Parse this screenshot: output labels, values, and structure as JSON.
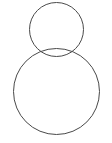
{
  "canvas": {
    "width": 112,
    "height": 143,
    "background_color": "#ffffff",
    "title": "Two overlapping circles"
  },
  "style": {
    "stroke_color": "#4a4a4a",
    "stroke_width": 1,
    "fill": "none"
  },
  "chart_data": {
    "type": "diagram",
    "shapes": [
      {
        "name": "small-circle",
        "kind": "circle",
        "center_x": 56.5,
        "center_y": 29.5,
        "radius": 27.5,
        "bbox": [
          29,
          2,
          84,
          57
        ],
        "stroke": "#4a4a4a",
        "fill": "none"
      },
      {
        "name": "large-circle",
        "kind": "circle",
        "center_x": 56.5,
        "center_y": 91.5,
        "radius": 43.5,
        "bbox": [
          13,
          48,
          100,
          135
        ],
        "stroke": "#4a4a4a",
        "fill": "none"
      }
    ],
    "relations": [
      {
        "type": "overlap",
        "between": [
          "small-circle",
          "large-circle"
        ],
        "center_distance": 62,
        "note": "Circles intersect; overlap forms a lens (vesica) shape near y=48 to y=57"
      }
    ],
    "labels": [],
    "legend": [],
    "grid": false
  }
}
